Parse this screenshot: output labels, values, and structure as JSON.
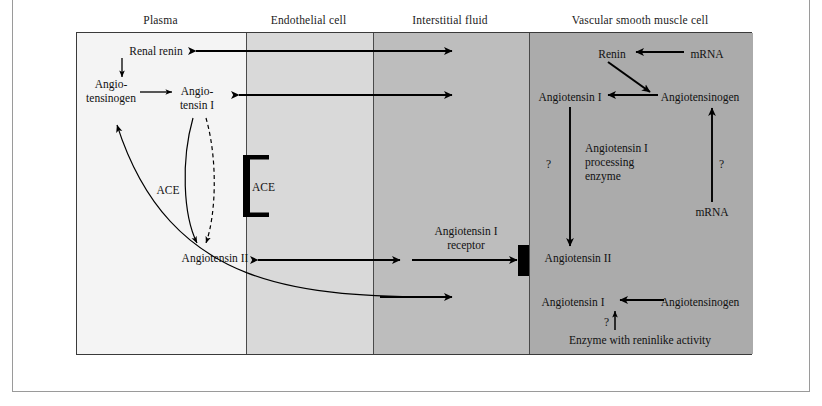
{
  "figure": {
    "columns": [
      {
        "key": "plasma",
        "header": "Plasma",
        "fill": "#f4f4f4"
      },
      {
        "key": "endothelial",
        "header": "Endothelial cell",
        "fill": "#d9d9d9"
      },
      {
        "key": "interstitial",
        "header": "Interstitial fluid",
        "fill": "#bdbdbd"
      },
      {
        "key": "vsmc",
        "header": "Vascular smooth muscle cell",
        "fill": "#ababab"
      }
    ],
    "frame_color": "#3a3a3a",
    "arrow_color": "#000000"
  },
  "plasma": {
    "renal_renin": "Renal renin",
    "angiotensinogen_line1": "Angio-",
    "angiotensinogen_line2": "tensinogen",
    "angiotensin_i_line1": "Angio-",
    "angiotensin_i_line2": "tensin I",
    "ace": "ACE",
    "angiotensin_ii": "Angiotensin II"
  },
  "endothelial": {
    "ace": "ACE"
  },
  "interstitial": {
    "receptor_line1": "Angiotensin I",
    "receptor_line2": "receptor"
  },
  "vsmc": {
    "renin": "Renin",
    "mrna_top": "mRNA",
    "angiotensin_i_top": "Angiotensin I",
    "angiotensinogen_top": "Angiotensinogen",
    "processing_enzyme_line1": "Angiotensin I",
    "processing_enzyme_line2": "processing",
    "processing_enzyme_line3": "enzyme",
    "question_left": "?",
    "question_right": "?",
    "mrna_bottom": "mRNA",
    "angiotensin_ii": "Angiotensin II",
    "angiotensin_i_bottom": "Angiotensin I",
    "angiotensinogen_bottom": "Angiotensinogen",
    "question_bottom": "?",
    "reninlike_enzyme": "Enzyme with reninlike activity"
  }
}
